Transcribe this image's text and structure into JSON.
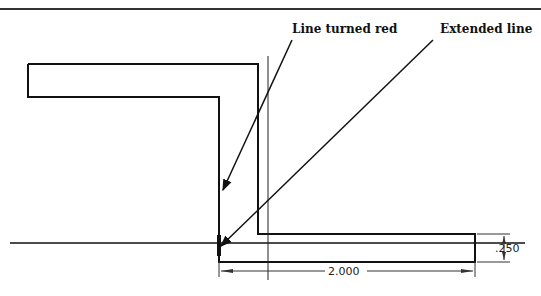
{
  "diagram": {
    "callouts": [
      {
        "id": "red-line",
        "label": "Line turned red"
      },
      {
        "id": "extended-line",
        "label": "Extended line"
      }
    ],
    "dimensions": {
      "length": "2.000",
      "thickness": ".250"
    },
    "colors": {
      "stroke": "#111111",
      "background": "#ffffff"
    }
  }
}
